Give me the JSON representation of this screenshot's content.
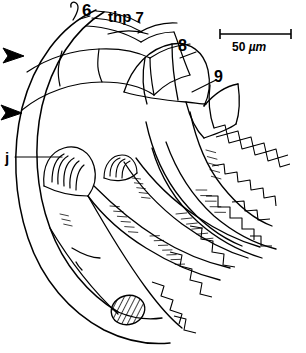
{
  "figure": {
    "kind": "scientific-line-drawing",
    "background_color": "#ffffff",
    "ink_color": "#000000"
  },
  "labels": {
    "seg6": "6",
    "thp7": "thp 7",
    "seg8": "8",
    "seg9": "9",
    "j": "j"
  },
  "scale_bar": {
    "value": "50",
    "unit": "µm",
    "text": "50 µm",
    "x_start": 220,
    "x_end": 291,
    "y": 34
  },
  "markers": {
    "arrowheads": [
      {
        "name": "arrowhead-upper",
        "x": 4,
        "y": 55
      },
      {
        "name": "arrowhead-lower",
        "x": 2,
        "y": 112
      }
    ],
    "hatched_ellipse": {
      "cx": 128,
      "cy": 310,
      "rx": 17,
      "ry": 14,
      "rotation": -20
    }
  }
}
